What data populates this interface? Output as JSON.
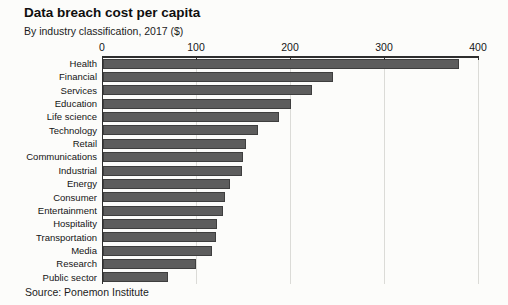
{
  "chart_data": {
    "type": "bar",
    "orientation": "horizontal",
    "title": "Data breach cost per capita",
    "subtitle": "By industry classification, 2017 ($)",
    "source": "Source: Ponemon Institute",
    "categories": [
      "Health",
      "Financial",
      "Services",
      "Education",
      "Life science",
      "Technology",
      "Retail",
      "Communications",
      "Industrial",
      "Energy",
      "Consumer",
      "Entertainment",
      "Hospitality",
      "Transportation",
      "Media",
      "Research",
      "Public sector"
    ],
    "values": [
      380,
      245,
      223,
      200,
      188,
      165,
      152,
      149,
      148,
      135,
      130,
      128,
      122,
      121,
      116,
      99,
      69
    ],
    "xlabel": "",
    "ylabel": "",
    "xlim": [
      0,
      400
    ],
    "x_ticks": [
      0,
      100,
      200,
      300,
      400
    ],
    "grid": "vertical light gridlines at each x tick",
    "legend": "none",
    "bar_color": "#5d5d5d",
    "bar_border_color": "#3e3e3e",
    "axis_color": "#2e2e2e",
    "gridline_color": "#dbdbd7",
    "background_color": "#fcfcfa"
  }
}
